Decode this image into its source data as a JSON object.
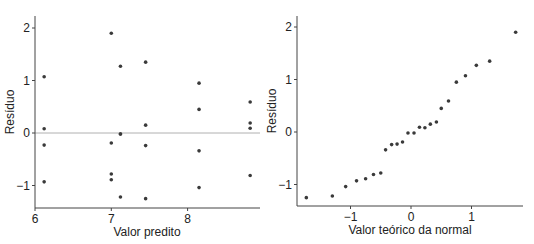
{
  "chart_data": [
    {
      "type": "scatter",
      "title": "",
      "xlabel": "Valor predito",
      "ylabel": "Resíduo",
      "xlim": [
        6,
        9.0
      ],
      "ylim": [
        -1.45,
        2.2
      ],
      "xticks": [
        6,
        7,
        8
      ],
      "yticks": [
        -1,
        0,
        1,
        2
      ],
      "reference_line": {
        "y": 0,
        "color": "#b0b0b0"
      },
      "grid": false,
      "points": [
        {
          "x": 6.12,
          "y": 1.07
        },
        {
          "x": 6.12,
          "y": 0.08
        },
        {
          "x": 6.12,
          "y": -0.23
        },
        {
          "x": 6.12,
          "y": -0.93
        },
        {
          "x": 7.0,
          "y": 1.9
        },
        {
          "x": 7.0,
          "y": -0.19
        },
        {
          "x": 7.0,
          "y": -0.78
        },
        {
          "x": 7.0,
          "y": -0.89
        },
        {
          "x": 7.12,
          "y": 1.27
        },
        {
          "x": 7.12,
          "y": -0.02
        },
        {
          "x": 7.12,
          "y": -0.02
        },
        {
          "x": 7.12,
          "y": -1.22
        },
        {
          "x": 7.45,
          "y": 1.35
        },
        {
          "x": 7.45,
          "y": 0.15
        },
        {
          "x": 7.45,
          "y": -0.24
        },
        {
          "x": 7.45,
          "y": -1.25
        },
        {
          "x": 8.15,
          "y": 0.95
        },
        {
          "x": 8.15,
          "y": 0.45
        },
        {
          "x": 8.15,
          "y": -0.34
        },
        {
          "x": 8.15,
          "y": -1.04
        },
        {
          "x": 8.82,
          "y": 0.59
        },
        {
          "x": 8.82,
          "y": 0.19
        },
        {
          "x": 8.82,
          "y": 0.09
        },
        {
          "x": 8.82,
          "y": -0.81
        }
      ]
    },
    {
      "type": "scatter",
      "title": "",
      "xlabel": "Valor teórico da normal",
      "ylabel": "Resíduo",
      "xlim": [
        -1.9,
        1.85
      ],
      "ylim": [
        -1.45,
        2.2
      ],
      "xticks": [
        -1,
        0,
        1
      ],
      "yticks": [
        -1,
        0,
        1,
        2
      ],
      "grid": false,
      "points": [
        {
          "x": -1.73,
          "y": -1.25
        },
        {
          "x": -1.3,
          "y": -1.22
        },
        {
          "x": -1.08,
          "y": -1.04
        },
        {
          "x": -0.9,
          "y": -0.93
        },
        {
          "x": -0.75,
          "y": -0.89
        },
        {
          "x": -0.62,
          "y": -0.81
        },
        {
          "x": -0.5,
          "y": -0.78
        },
        {
          "x": -0.42,
          "y": -0.34
        },
        {
          "x": -0.32,
          "y": -0.24
        },
        {
          "x": -0.23,
          "y": -0.23
        },
        {
          "x": -0.14,
          "y": -0.19
        },
        {
          "x": -0.05,
          "y": -0.02
        },
        {
          "x": 0.05,
          "y": -0.02
        },
        {
          "x": 0.14,
          "y": 0.09
        },
        {
          "x": 0.23,
          "y": 0.08
        },
        {
          "x": 0.32,
          "y": 0.15
        },
        {
          "x": 0.42,
          "y": 0.19
        },
        {
          "x": 0.5,
          "y": 0.45
        },
        {
          "x": 0.62,
          "y": 0.59
        },
        {
          "x": 0.75,
          "y": 0.95
        },
        {
          "x": 0.9,
          "y": 1.07
        },
        {
          "x": 1.08,
          "y": 1.27
        },
        {
          "x": 1.3,
          "y": 1.35
        },
        {
          "x": 1.73,
          "y": 1.9
        }
      ]
    }
  ],
  "colors": {
    "axis": "#444444",
    "point": "#3a3a3a",
    "zero_line": "#b0b0b0"
  }
}
